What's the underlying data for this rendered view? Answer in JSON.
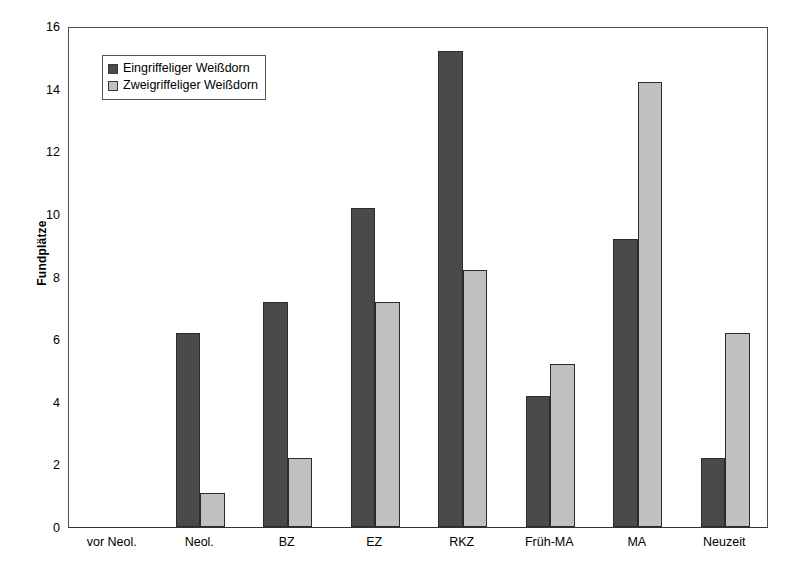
{
  "chart_data": {
    "type": "bar",
    "title": "",
    "xlabel": "",
    "ylabel": "Fundplätze",
    "ylim": [
      0,
      16
    ],
    "ytick_step": 2,
    "yticks": [
      16,
      14,
      12,
      10,
      8,
      6,
      4,
      2,
      0
    ],
    "grid": false,
    "legend_position": "upper left (inside plot)",
    "categories": [
      "vor Neol.",
      "Neol.",
      "BZ",
      "EZ",
      "RKZ",
      "Früh-MA",
      "MA",
      "Neuzeit"
    ],
    "series": [
      {
        "name": "Eingriffeliger Weißdorn",
        "color": "#4a4a4a",
        "values": [
          0,
          6.2,
          7.2,
          10.2,
          15.2,
          4.2,
          9.2,
          2.2
        ]
      },
      {
        "name": "Zweigriffeliger Weißdorn",
        "color": "#c0c0c0",
        "values": [
          0,
          1.1,
          2.2,
          7.2,
          8.2,
          5.2,
          14.2,
          6.2
        ]
      }
    ]
  },
  "axis": {
    "y_title": "Fundplätze"
  },
  "colors": {
    "series_dark": "#4a4a4a",
    "series_light": "#c0c0c0",
    "axis_line": "#4d4d4d",
    "bar_border": "#2b2b2b",
    "background": "#ffffff"
  }
}
